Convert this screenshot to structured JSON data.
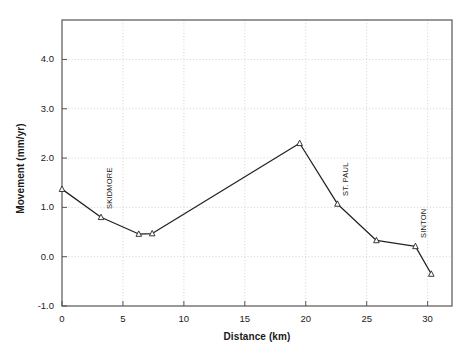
{
  "chart_data": {
    "type": "line",
    "title": "",
    "xlabel": "Distance (km)",
    "ylabel": "Movement (mm/yr)",
    "xlim": [
      0,
      32
    ],
    "ylim": [
      -1.0,
      4.8
    ],
    "xticks": [
      0,
      5,
      10,
      15,
      20,
      25,
      30
    ],
    "xticklabels": [
      "0",
      "5",
      "10",
      "15",
      "20",
      "25",
      "30"
    ],
    "yticks": [
      -1.0,
      0.0,
      1.0,
      2.0,
      3.0,
      4.0
    ],
    "yticklabels": [
      "-1.0",
      "0.0",
      "1.0",
      "2.0",
      "3.0",
      "4.0"
    ],
    "grid": true,
    "grid_style": "dotted",
    "legend": "none",
    "marker": "triangle-open",
    "line_color": "#222222",
    "grid_color": "#cccccc",
    "series": [
      {
        "name": "Movement profile",
        "x": [
          0.0,
          3.2,
          6.3,
          7.4,
          19.5,
          22.6,
          25.8,
          29.0,
          30.3
        ],
        "y": [
          1.37,
          0.8,
          0.46,
          0.47,
          2.3,
          1.07,
          0.33,
          0.21,
          -0.35
        ]
      }
    ],
    "annotations": [
      {
        "text": "SKIDMORE",
        "x": 3.2,
        "y": 0.8,
        "rotation": 90
      },
      {
        "text": "ST. PAUL",
        "x": 22.6,
        "y": 1.07,
        "rotation": 90
      },
      {
        "text": "SINTON",
        "x": 29.0,
        "y": 0.21,
        "rotation": 90
      }
    ]
  }
}
